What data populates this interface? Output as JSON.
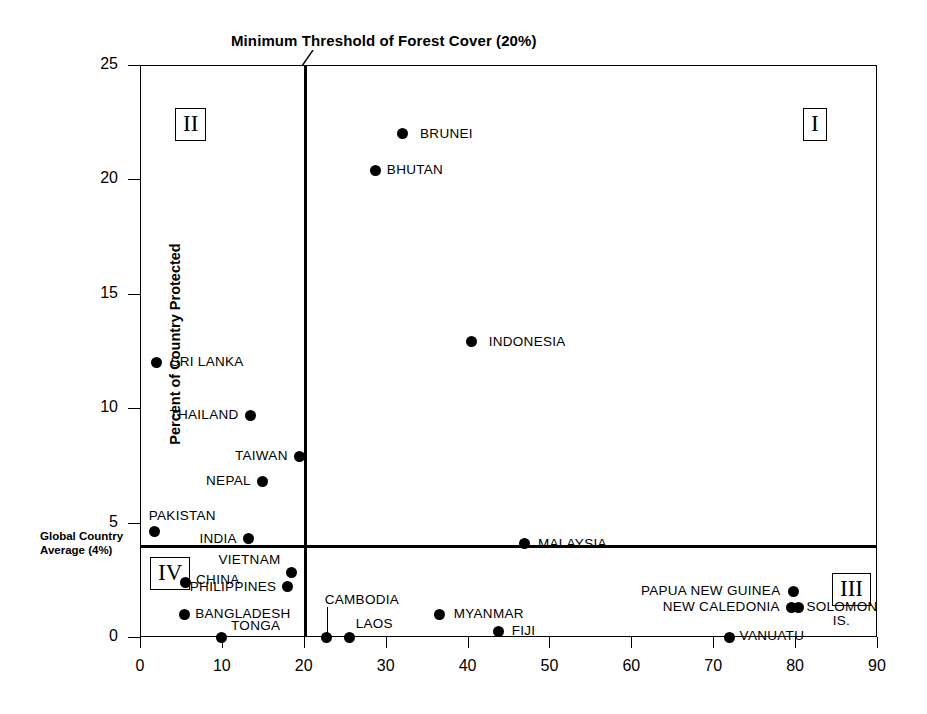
{
  "chart_data": {
    "type": "scatter",
    "title": "Minimum Threshold of Forest Cover (20%)",
    "xlabel": "",
    "ylabel": "Percent of Country Protected",
    "xlim": [
      0,
      90
    ],
    "ylim": [
      0,
      25
    ],
    "xticks": [
      "0",
      "10",
      "20",
      "30",
      "40",
      "50",
      "60",
      "70",
      "80",
      "90"
    ],
    "yticks": [
      "0",
      "5",
      "10",
      "15",
      "20",
      "25"
    ],
    "grid": false,
    "legend": "none",
    "reference_lines": [
      {
        "name": "forest-cover-threshold",
        "orientation": "vertical",
        "value": 20,
        "label": "Minimum Threshold of Forest Cover (20%)"
      },
      {
        "name": "global-country-average",
        "orientation": "horizontal",
        "value": 4,
        "label": "Global Country Average (4%)"
      }
    ],
    "average_label_line1": "Global Country",
    "average_label_line2": "Average (4%)",
    "quadrants": [
      {
        "id": "I",
        "label": "I"
      },
      {
        "id": "II",
        "label": "II"
      },
      {
        "id": "III",
        "label": "III"
      },
      {
        "id": "IV",
        "label": "IV"
      }
    ],
    "points": [
      {
        "name": "BRUNEI",
        "x": 32.0,
        "y": 22.0
      },
      {
        "name": "BHUTAN",
        "x": 28.8,
        "y": 20.4
      },
      {
        "name": "INDONESIA",
        "x": 40.5,
        "y": 12.9
      },
      {
        "name": "SRI LANKA",
        "x": 2.0,
        "y": 12.0
      },
      {
        "name": "THAILAND",
        "x": 13.5,
        "y": 9.7
      },
      {
        "name": "TAIWAN",
        "x": 19.5,
        "y": 7.9
      },
      {
        "name": "NEPAL",
        "x": 15.0,
        "y": 6.8
      },
      {
        "name": "PAKISTAN",
        "x": 1.8,
        "y": 4.6
      },
      {
        "name": "INDIA",
        "x": 13.3,
        "y": 4.3
      },
      {
        "name": "MALAYSIA",
        "x": 47.0,
        "y": 4.1
      },
      {
        "name": "VIETNAM",
        "x": 18.5,
        "y": 2.8
      },
      {
        "name": "CHINA",
        "x": 5.5,
        "y": 2.4
      },
      {
        "name": "PHILIPPINES",
        "x": 18.0,
        "y": 2.2
      },
      {
        "name": "PAPUA NEW GUINEA",
        "x": 79.8,
        "y": 2.0
      },
      {
        "name": "NEW CALEDONIA",
        "x": 79.6,
        "y": 1.3
      },
      {
        "name": "SOLOMON IS.",
        "x": 80.4,
        "y": 1.3
      },
      {
        "name": "BANGLADESH",
        "x": 5.4,
        "y": 1.0
      },
      {
        "name": "MYANMAR",
        "x": 36.6,
        "y": 1.0
      },
      {
        "name": "FIJI",
        "x": 43.8,
        "y": 0.25
      },
      {
        "name": "TONGA",
        "x": 9.9,
        "y": 0.0
      },
      {
        "name": "CAMBODIA",
        "x": 22.8,
        "y": 0.0
      },
      {
        "name": "LAOS",
        "x": 25.6,
        "y": 0.0
      },
      {
        "name": "VANUATU",
        "x": 72.0,
        "y": 0.0
      }
    ]
  }
}
